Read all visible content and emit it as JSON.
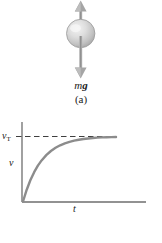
{
  "figure": {
    "panel_a": {
      "caption": "(a)",
      "force_label_m": "m",
      "force_label_g": "g",
      "up_arrow_name": "drag-force-arrow-up",
      "down_arrow_name": "gravity-force-arrow-down",
      "object_name": "falling-sphere",
      "arrow_color": "#9a9a9a",
      "sphere_color": "#c9c9c9"
    },
    "panel_b": {
      "caption": "(b)",
      "y_axis_label": "v",
      "y_tick_label_base": "v",
      "y_tick_label_sub": "T",
      "x_axis_label": "t",
      "curve_color": "#8c8c8c",
      "axis_color": "#6e6e6e",
      "dashed_color": "#4a4a4a"
    }
  },
  "chart_data": {
    "type": "line",
    "title": "",
    "subtitle": "",
    "xlabel": "t",
    "ylabel": "v",
    "xlim": [
      0,
      1
    ],
    "ylim": [
      0,
      1.12
    ],
    "grid": false,
    "legend": null,
    "annotations": [
      {
        "name": "terminal-velocity-asymptote",
        "label": "v_T",
        "type": "horizontal-dashed-line",
        "y": 1.0
      }
    ],
    "xtick_labels": [],
    "ytick_labels": [
      "v_T"
    ],
    "ytick_values": [
      1.0
    ],
    "series": [
      {
        "name": "velocity-vs-time",
        "description": "v(t) = v_T (1 - e^{-t/tau}), approaching terminal velocity",
        "x": [
          0.0,
          0.04,
          0.08,
          0.12,
          0.16,
          0.2,
          0.25,
          0.3,
          0.35,
          0.4,
          0.45,
          0.5,
          0.55,
          0.6,
          0.65,
          0.7,
          0.75,
          0.8,
          0.85,
          0.9,
          0.95,
          1.0
        ],
        "y": [
          0.0,
          0.181,
          0.33,
          0.451,
          0.551,
          0.632,
          0.713,
          0.777,
          0.826,
          0.865,
          0.895,
          0.918,
          0.936,
          0.95,
          0.961,
          0.97,
          0.976,
          0.982,
          0.986,
          0.989,
          0.991,
          0.993
        ]
      }
    ]
  }
}
